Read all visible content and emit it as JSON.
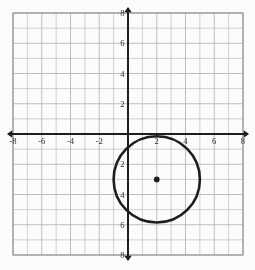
{
  "chart_data": {
    "type": "scatter",
    "title": "",
    "xlabel": "",
    "ylabel": "",
    "xlim": [
      -8,
      8
    ],
    "ylim": [
      -8,
      8
    ],
    "grid": true,
    "grid_step": 1,
    "legend": "none",
    "x_tick_labels": [
      "-8",
      "-6",
      "-4",
      "-2",
      "2",
      "4",
      "6",
      "8"
    ],
    "x_tick_values": [
      -8,
      -6,
      -4,
      -2,
      2,
      4,
      6,
      8
    ],
    "y_tick_labels": [
      "8",
      "6",
      "4",
      "2",
      "2",
      "4",
      "6",
      "8"
    ],
    "y_tick_values": [
      8,
      6,
      4,
      2,
      -2,
      -4,
      -6,
      -8
    ],
    "axis_arrows": [
      "left",
      "right",
      "up",
      "down"
    ],
    "shapes": [
      {
        "kind": "circle",
        "center_x": 2,
        "center_y": -3,
        "radius": 3,
        "stroke": "#1a1a1a",
        "fill": "none",
        "center_marker": true
      }
    ],
    "points": [
      {
        "label": "center",
        "x": 2,
        "y": -3
      }
    ],
    "annotations": []
  },
  "figure": {
    "name": "coordinate-plane-with-circle",
    "grid_color": "#b4b4b4",
    "grid_major_color": "#8a8a8a",
    "axis_color": "#1a1a1a",
    "curve_color": "#111111",
    "background": "#ffffff",
    "tick_label_color": "#2b2b2b"
  }
}
